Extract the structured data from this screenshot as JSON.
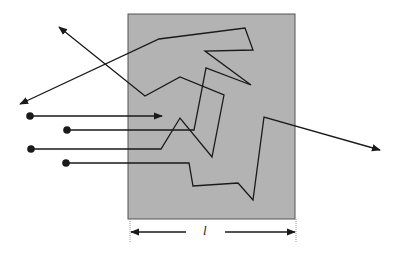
{
  "diagram": {
    "slab": {
      "x": 128,
      "y": 14,
      "width": 167,
      "height": 205,
      "fill": "#b3b3b3",
      "stroke": "#555555"
    },
    "dimension": {
      "label": "l",
      "y": 232,
      "x1": 130,
      "x2": 296
    },
    "colors": {
      "line": "#1a1a1a",
      "slab": "#b3b3b3"
    },
    "rays": [
      {
        "name": "ray-1-absorbed",
        "source": [
          30,
          116
        ],
        "points": [
          [
            30,
            116
          ],
          [
            162,
            116
          ]
        ]
      },
      {
        "name": "ray-2-backscattered",
        "source": [
          67,
          130
        ],
        "points": [
          [
            67,
            130
          ],
          [
            194,
            130
          ],
          [
            206,
            68
          ],
          [
            251,
            85
          ],
          [
            205,
            51
          ],
          [
            253,
            50
          ],
          [
            245,
            28
          ],
          [
            159,
            39
          ],
          [
            20,
            104
          ]
        ]
      },
      {
        "name": "ray-3-backscattered",
        "source": [
          31,
          149
        ],
        "points": [
          [
            31,
            149
          ],
          [
            161,
            149
          ],
          [
            180,
            118
          ],
          [
            212,
            157
          ],
          [
            224,
            95
          ],
          [
            180,
            77
          ],
          [
            145,
            96
          ],
          [
            59,
            27
          ]
        ]
      },
      {
        "name": "ray-4-transmitted",
        "source": [
          66,
          163
        ],
        "points": [
          [
            66,
            163
          ],
          [
            189,
            163
          ],
          [
            193,
            186
          ],
          [
            238,
            183
          ],
          [
            253,
            200
          ],
          [
            264,
            117
          ],
          [
            380,
            150
          ]
        ]
      }
    ]
  }
}
